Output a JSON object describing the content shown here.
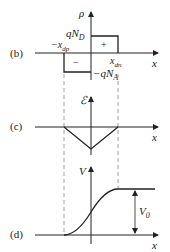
{
  "figure": {
    "panels": [
      {
        "id": "b",
        "label": "(b)",
        "y_axis_label": "ρ",
        "x_axis_label": "x",
        "positive_sign": "+",
        "negative_sign": "−",
        "top_value": {
          "prefix": "qN",
          "sub": "D"
        },
        "bottom_value": {
          "prefix": "−qN",
          "sub": "A"
        },
        "left_edge": {
          "prefix": "−x",
          "sub": "dp"
        },
        "right_edge": {
          "prefix": "x",
          "sub": "dn"
        }
      },
      {
        "id": "c",
        "label": "(c)",
        "y_axis_label": "ℰ",
        "x_axis_label": "x"
      },
      {
        "id": "d",
        "label": "(d)",
        "y_axis_label": "V",
        "x_axis_label": "x",
        "step_value": {
          "prefix": "V",
          "sub": "0"
        }
      }
    ],
    "colors": {
      "line": "#222222",
      "dashed": "#888888"
    }
  }
}
